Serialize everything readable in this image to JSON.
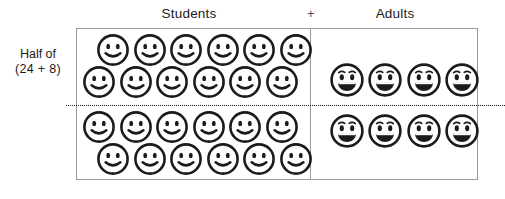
{
  "diagram": {
    "title_left": "Students",
    "operator": "+",
    "title_right": "Adults",
    "caption_line1": "Half of",
    "caption_line2": "(24 + 8)",
    "divider_style": "dotted",
    "border_color": "#9a9a9a",
    "ink_color": "#1b1b1b",
    "background": "#ffffff"
  },
  "chart_data": {
    "type": "pictograph",
    "title": "Half of (24 + 8)",
    "categories": [
      "Students",
      "Adults"
    ],
    "values": [
      24,
      8
    ],
    "total": 32,
    "half_total": 16,
    "operator": "+",
    "legend": [
      {
        "name": "student-face",
        "label": "Students",
        "glyph": "smiley-plain"
      },
      {
        "name": "adult-face",
        "label": "Adults",
        "glyph": "smiley-eyebrows"
      }
    ],
    "groups": [
      {
        "name": "Students",
        "count": 24,
        "above_line": 12,
        "below_line": 12,
        "rows": [
          {
            "id": "s-row1",
            "count": 6,
            "half": "above"
          },
          {
            "id": "s-row2",
            "count": 6,
            "half": "above"
          },
          {
            "id": "s-row3",
            "count": 6,
            "half": "below"
          },
          {
            "id": "s-row4",
            "count": 6,
            "half": "below"
          }
        ]
      },
      {
        "name": "Adults",
        "count": 8,
        "above_line": 4,
        "below_line": 4,
        "rows": [
          {
            "id": "a-row1",
            "count": 4,
            "half": "above"
          },
          {
            "id": "a-row2",
            "count": 4,
            "half": "below"
          }
        ]
      }
    ],
    "annotations": [
      "Half of",
      "(24 + 8)"
    ],
    "grid": false,
    "legend_position": "top"
  },
  "icons": {
    "student_face": "smiley-face-icon",
    "adult_face": "smiley-face-eyebrows-icon"
  }
}
